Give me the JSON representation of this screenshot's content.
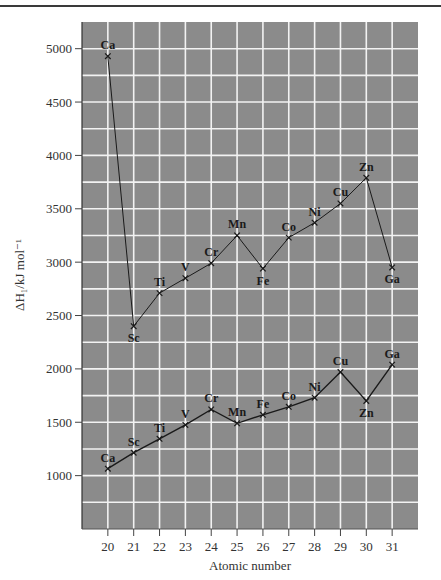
{
  "chart_data": {
    "type": "line",
    "title": "",
    "xlabel": "Atomic number",
    "ylabel": "ΔH₁/kJ mol⁻¹",
    "xlim": [
      19,
      32
    ],
    "ylim": [
      500,
      5250
    ],
    "grid": true,
    "legend": null,
    "x_ticks": [
      20,
      21,
      22,
      23,
      24,
      25,
      26,
      27,
      28,
      29,
      30,
      31
    ],
    "y_ticks": [
      1000,
      1500,
      2000,
      2500,
      3000,
      3500,
      4000,
      4500,
      5000
    ],
    "series": [
      {
        "name": "upper",
        "x": [
          20,
          21,
          22,
          23,
          24,
          25,
          26,
          27,
          28,
          29,
          30,
          31
        ],
        "labels": [
          "Ca",
          "Sc",
          "Ti",
          "V",
          "Cr",
          "Mn",
          "Fe",
          "Co",
          "Ni",
          "Cu",
          "Zn",
          "Ga"
        ],
        "values": [
          4930,
          2400,
          2710,
          2850,
          2990,
          3250,
          2940,
          3230,
          3370,
          3550,
          3790,
          2950
        ],
        "label_pos": [
          "above",
          "below",
          "above",
          "above",
          "above",
          "above",
          "below",
          "above",
          "above",
          "above",
          "above",
          "below"
        ]
      },
      {
        "name": "lower",
        "x": [
          20,
          21,
          22,
          23,
          24,
          25,
          26,
          27,
          28,
          29,
          30,
          31
        ],
        "labels": [
          "Ca",
          "Sc",
          "Ti",
          "V",
          "Cr",
          "Mn",
          "Fe",
          "Co",
          "Ni",
          "Cu",
          "Zn",
          "Ga"
        ],
        "values": [
          1065,
          1215,
          1345,
          1475,
          1620,
          1490,
          1570,
          1645,
          1730,
          1970,
          1700,
          2040
        ],
        "label_pos": [
          "above",
          "above",
          "above",
          "above",
          "above",
          "above",
          "above",
          "above",
          "above",
          "above",
          "below",
          "above"
        ]
      }
    ]
  },
  "colors": {
    "plot_background": "#8b8b8b",
    "grid": "#f2f2f2",
    "line": "#1a1a1a",
    "top_rule": "#3a3a3a"
  }
}
